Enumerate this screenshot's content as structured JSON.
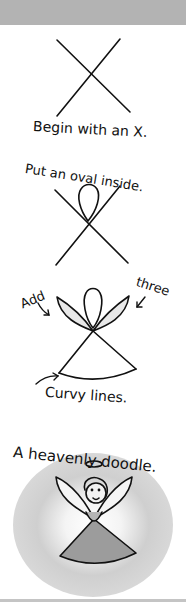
{
  "tutorial": {
    "steps": [
      {
        "caption": "Begin with an X."
      },
      {
        "caption": "Put an oval inside."
      },
      {
        "caption_left": "Add",
        "caption_right": "three",
        "caption_bottom": "Curvy lines."
      },
      {
        "caption": "A heavenly doodle."
      }
    ]
  },
  "colors": {
    "topbar": "#b3b3b3",
    "ink": "#111111",
    "wing_shade": "#e6e6e6",
    "glow": "#c8c8c8",
    "robe": "#9a9a9a",
    "face": "#f2f2f2"
  }
}
